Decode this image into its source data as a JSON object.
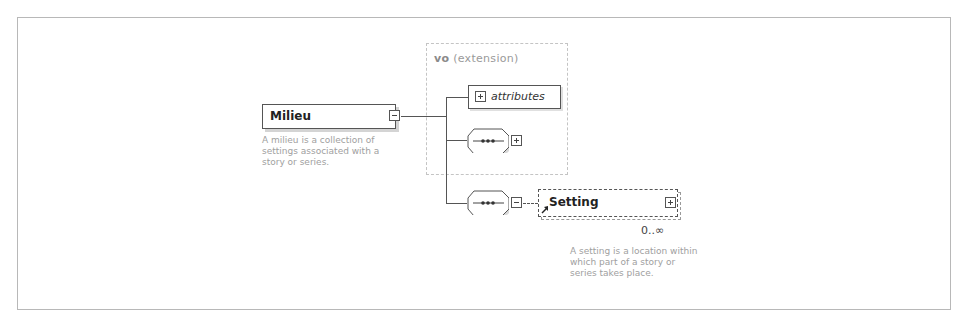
{
  "diagram": {
    "root_element": {
      "name": "Milieu",
      "toggle": "collapse",
      "description": [
        "A milieu is a collection of",
        "settings associated with a",
        "story or series."
      ]
    },
    "extension_group": {
      "prefix": "vo",
      "label": "(extension)",
      "attributes_label": "attributes",
      "attributes_toggle": "expand",
      "sequence_toggle": "expand"
    },
    "sequence": {
      "toggle": "collapse",
      "child_element": {
        "name": "Setting",
        "toggle": "expand",
        "is_reference": true,
        "occurrence": "0..∞",
        "description": [
          "A setting is a location within",
          "which part of a story or",
          "series takes place."
        ]
      }
    }
  }
}
